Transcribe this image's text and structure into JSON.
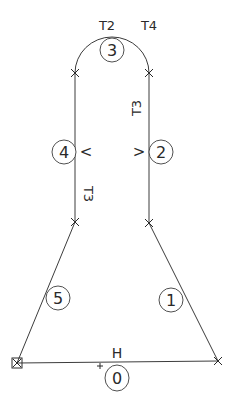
{
  "diagram": {
    "title": "",
    "colors": {
      "line": "#3c3c3c",
      "text": "#2a2a2a",
      "background": "#ffffff"
    },
    "segments": [
      {
        "id": "0",
        "label": "0",
        "type": "line",
        "annotation": "H"
      },
      {
        "id": "1",
        "label": "1",
        "type": "line",
        "annotation": ""
      },
      {
        "id": "2",
        "label": "2",
        "type": "line",
        "annotation": "V",
        "side_text": "T3"
      },
      {
        "id": "3",
        "label": "3",
        "type": "arc",
        "annotation": "",
        "end_labels": [
          "T2",
          "T4"
        ]
      },
      {
        "id": "4",
        "label": "4",
        "type": "line",
        "annotation": "V",
        "side_text": "T3"
      },
      {
        "id": "5",
        "label": "5",
        "type": "line",
        "annotation": ""
      }
    ],
    "texts": {
      "t2": "T2",
      "t4": "T4",
      "t3_right": "T3",
      "t3_left": "T3",
      "v_left": "<",
      "v_right": ">",
      "h": "H",
      "n0": "0",
      "n1": "1",
      "n2": "2",
      "n3": "3",
      "n4": "4",
      "n5": "5"
    },
    "nodes": [
      {
        "name": "start",
        "marker": "boxed-x",
        "x": 17,
        "y": 363
      },
      {
        "name": "bottom-right",
        "marker": "x",
        "x": 218,
        "y": 361
      },
      {
        "name": "right-lower",
        "marker": "x",
        "x": 149,
        "y": 223
      },
      {
        "name": "right-upper",
        "marker": "x",
        "x": 149,
        "y": 73
      },
      {
        "name": "left-upper",
        "marker": "x",
        "x": 75,
        "y": 73
      },
      {
        "name": "left-lower",
        "marker": "x",
        "x": 75,
        "y": 222
      },
      {
        "name": "mid-bottom",
        "marker": "plus",
        "x": 100,
        "y": 366
      }
    ]
  }
}
